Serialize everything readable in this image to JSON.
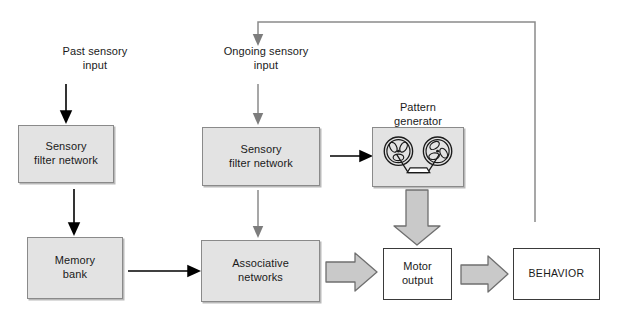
{
  "diagram": {
    "colors": {
      "shaded_fill": "#e3e3e3",
      "shaded_border": "#8a8a8a",
      "plain_border": "#3a3a3a",
      "black_arrow": "#000000",
      "gray_arrow": "#8a8a8a",
      "block_arrow_fill": "#c9c9c9",
      "background": "#ffffff"
    },
    "captions": {
      "past_sensory_input": "Past sensory\ninput",
      "ongoing_sensory_input": "Ongoing sensory\ninput",
      "pattern_generator": "Pattern\ngenerator"
    },
    "boxes": {
      "sensory_filter_left": "Sensory\nfilter network",
      "memory_bank": "Memory\nbank",
      "sensory_filter_mid": "Sensory\nfilter network",
      "associative_networks": "Associative\nnetworks",
      "motor_output": "Motor\noutput",
      "behavior": "BEHAVIOR"
    },
    "connectors": [
      {
        "name": "past-input-to-sensory-filter-left",
        "style": "thin-black-arrow",
        "direction": "down"
      },
      {
        "name": "sensory-filter-left-to-memory-bank",
        "style": "thin-black-arrow",
        "direction": "down"
      },
      {
        "name": "memory-bank-to-associative-networks",
        "style": "thin-black-arrow",
        "direction": "right"
      },
      {
        "name": "ongoing-input-to-sensory-filter-mid",
        "style": "thin-gray-arrow",
        "direction": "down"
      },
      {
        "name": "sensory-filter-mid-to-associative-networks",
        "style": "thin-gray-arrow",
        "direction": "down"
      },
      {
        "name": "sensory-filter-mid-to-pattern-generator",
        "style": "thin-black-arrow",
        "direction": "right"
      },
      {
        "name": "pattern-generator-to-motor-output",
        "style": "block-arrow",
        "direction": "down"
      },
      {
        "name": "associative-networks-to-motor-output",
        "style": "block-arrow",
        "direction": "right"
      },
      {
        "name": "motor-output-to-behavior",
        "style": "block-arrow",
        "direction": "right"
      },
      {
        "name": "behavior-feedback-to-ongoing-input",
        "style": "thin-gray-feedback",
        "direction": "up-left-down"
      }
    ]
  }
}
